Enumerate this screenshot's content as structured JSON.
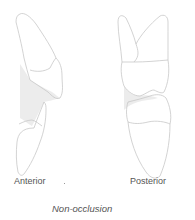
{
  "figure": {
    "labels": {
      "anterior": "Anterior",
      "posterior": "Posterior"
    },
    "caption": "Non-occlusion",
    "colors": {
      "outline": "#c8c8c8",
      "shading": "#ececec",
      "text": "#555555"
    }
  }
}
